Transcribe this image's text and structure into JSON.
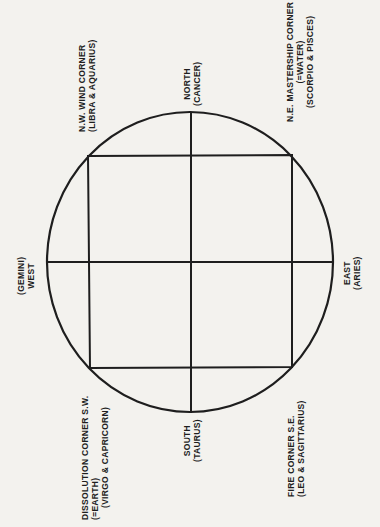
{
  "diagram": {
    "type": "compass-diagram",
    "colors": {
      "background": "#f3f2ee",
      "ink": "#1e1e1e"
    },
    "labels": {
      "north": {
        "line1": "NORTH",
        "line2": "(CANCER)"
      },
      "south": {
        "line1": "SOUTH",
        "line2": "(TAURUS)"
      },
      "east": {
        "line1": "EAST",
        "line2": "(ARIES)"
      },
      "west": {
        "line1": "(GEMINI)",
        "line2": "WEST"
      },
      "nw": {
        "line1": "N.W.   WIND CORNER",
        "line2": "(LIBRA & AQUARIUS)"
      },
      "ne": {
        "line1": "N.E.   MASTERSHIP CORNER",
        "line2": "(=WATER)",
        "line3": "(SCORPIO & PISCES)"
      },
      "sw": {
        "line1": "DISSOLUTION CORNER   S.W.",
        "line2": "(=EARTH)",
        "line3": "(VIRGO & CAPRICORN)"
      },
      "se": {
        "line1": "FIRE CORNER   S.E.",
        "line2": "(LEO & SAGITTARIUS)"
      }
    }
  }
}
